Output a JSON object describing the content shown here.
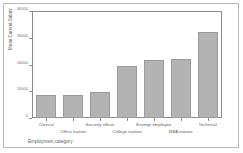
{
  "chart_data": {
    "type": "bar",
    "title": "",
    "xlabel": "Employment category",
    "ylabel": "Mean Current Salary",
    "categories": [
      "Clerical",
      "Office trainee",
      "Security officer",
      "College trainee",
      "Exempt employee",
      "MBA trainee",
      "Technical"
    ],
    "values": [
      8600,
      8600,
      9700,
      19800,
      22000,
      22400,
      32500
    ],
    "ylim": [
      0,
      40000
    ],
    "yticks": [
      0,
      10000,
      20000,
      30000,
      40000
    ],
    "ytick_labels": [
      "0",
      "10000",
      "20000",
      "30000",
      "40000"
    ],
    "grid": false,
    "legend": false,
    "bar_color": "#b3b3b3",
    "bar_edge_color": "#9a9a9a",
    "axis_color": "#8c8c8c",
    "text_color": "#5d5d5d"
  }
}
